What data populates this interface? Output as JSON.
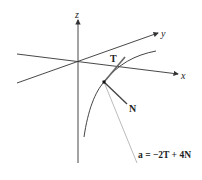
{
  "axes": {
    "x_label": "x",
    "y_label": "y",
    "z_label": "z"
  },
  "vectors": {
    "tangent_label": "T",
    "normal_label": "N",
    "acceleration_label": "a = −2T + 4N"
  },
  "colors": {
    "axis": "#333333",
    "curve": "#444444",
    "acceleration": "#bbbbbb"
  }
}
